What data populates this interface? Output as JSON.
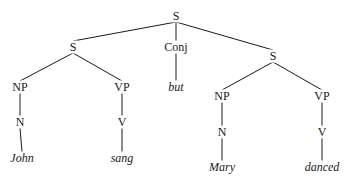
{
  "diagram": {
    "type": "syntax-tree",
    "nodes": [
      {
        "id": "s_root",
        "label": "S",
        "x": 176,
        "y": 16,
        "kind": "category"
      },
      {
        "id": "s_left",
        "label": "S",
        "x": 73,
        "y": 47,
        "kind": "category"
      },
      {
        "id": "conj",
        "label": "Conj",
        "x": 176,
        "y": 47,
        "kind": "category"
      },
      {
        "id": "s_right",
        "label": "S",
        "x": 273,
        "y": 56,
        "kind": "category"
      },
      {
        "id": "np_left",
        "label": "NP",
        "x": 20,
        "y": 87,
        "kind": "category"
      },
      {
        "id": "vp_left",
        "label": "VP",
        "x": 122,
        "y": 87,
        "kind": "category"
      },
      {
        "id": "but",
        "label": "but",
        "x": 176,
        "y": 87,
        "kind": "word"
      },
      {
        "id": "np_right",
        "label": "NP",
        "x": 222,
        "y": 96,
        "kind": "category"
      },
      {
        "id": "vp_right",
        "label": "VP",
        "x": 322,
        "y": 96,
        "kind": "category"
      },
      {
        "id": "n_left",
        "label": "N",
        "x": 20,
        "y": 122,
        "kind": "category"
      },
      {
        "id": "v_left",
        "label": "V",
        "x": 122,
        "y": 122,
        "kind": "category"
      },
      {
        "id": "n_right",
        "label": "N",
        "x": 222,
        "y": 132,
        "kind": "category"
      },
      {
        "id": "v_right",
        "label": "V",
        "x": 322,
        "y": 132,
        "kind": "category"
      },
      {
        "id": "john",
        "label": "John",
        "x": 22,
        "y": 158,
        "kind": "word"
      },
      {
        "id": "sang",
        "label": "sang",
        "x": 122,
        "y": 158,
        "kind": "word"
      },
      {
        "id": "mary",
        "label": "Mary",
        "x": 222,
        "y": 167,
        "kind": "word"
      },
      {
        "id": "danced",
        "label": "danced",
        "x": 322,
        "y": 167,
        "kind": "word"
      }
    ],
    "edges": [
      [
        "s_root",
        "s_left"
      ],
      [
        "s_root",
        "conj"
      ],
      [
        "s_root",
        "s_right"
      ],
      [
        "s_left",
        "np_left"
      ],
      [
        "s_left",
        "vp_left"
      ],
      [
        "conj",
        "but"
      ],
      [
        "s_right",
        "np_right"
      ],
      [
        "s_right",
        "vp_right"
      ],
      [
        "np_left",
        "n_left"
      ],
      [
        "vp_left",
        "v_left"
      ],
      [
        "np_right",
        "n_right"
      ],
      [
        "vp_right",
        "v_right"
      ],
      [
        "n_left",
        "john"
      ],
      [
        "v_left",
        "sang"
      ],
      [
        "n_right",
        "mary"
      ],
      [
        "v_right",
        "danced"
      ]
    ],
    "colors": {
      "line": "#1a1a1a",
      "text": "#1a1a1a",
      "background": "#ffffff"
    }
  }
}
